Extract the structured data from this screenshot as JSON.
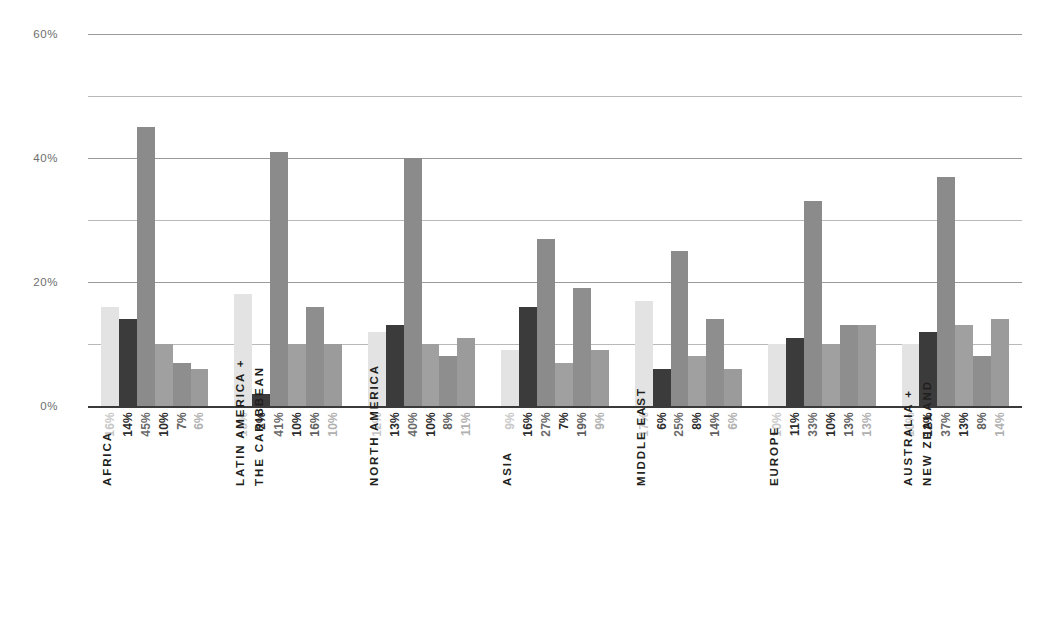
{
  "chart_data": {
    "type": "bar",
    "title": "",
    "subtitle": "",
    "xlabel": "",
    "ylabel": "",
    "ylim": [
      0,
      60
    ],
    "yticks": [
      "0%",
      "20%",
      "40%",
      "60%"
    ],
    "ytick_values": [
      0,
      20,
      40,
      60
    ],
    "minor_gridlines": [
      10,
      30,
      50
    ],
    "grid": true,
    "legend": "none",
    "value_labels": true,
    "series": [
      {
        "name": "series-1",
        "color": "#e0e0e0",
        "values": [
          16,
          18,
          12,
          9,
          17,
          10,
          10
        ]
      },
      {
        "name": "series-2",
        "color": "#3c3c3c",
        "values": [
          14,
          2,
          13,
          16,
          6,
          11,
          12
        ]
      },
      {
        "name": "series-3",
        "color": "#8c8c8c",
        "values": [
          45,
          41,
          40,
          27,
          25,
          33,
          37
        ]
      },
      {
        "name": "series-4",
        "color": "#9e9e9e",
        "values": [
          10,
          10,
          10,
          7,
          8,
          10,
          13
        ]
      },
      {
        "name": "series-5",
        "color": "#8f8f8f",
        "values": [
          7,
          16,
          8,
          19,
          14,
          13,
          8
        ]
      },
      {
        "name": "series-6",
        "color": "#9a9a9a",
        "values": [
          6,
          10,
          11,
          9,
          6,
          13,
          14
        ]
      }
    ],
    "categories": [
      "AFRICA",
      "LATIN AMERICA + THE CARIBBEAN",
      "NORTH AMERICA",
      "ASIA",
      "MIDDLE EAST",
      "EUROPE",
      "AUSTRALIA + NEW ZEALAND"
    ],
    "groups": [
      {
        "id": "africa",
        "label_lines": [
          "AFRICA"
        ],
        "value_labels": [
          "16%",
          "14%",
          "45%",
          "10%",
          "7%",
          "6%"
        ],
        "values": [
          16,
          14,
          45,
          10,
          7,
          6
        ]
      },
      {
        "id": "latin-america-caribbean",
        "label_lines": [
          "LATIN AMERICA +",
          "THE CARIBBEAN"
        ],
        "value_labels": [
          "18%",
          "2%",
          "41%",
          "10%",
          "16%",
          "10%"
        ],
        "values": [
          18,
          2,
          41,
          10,
          16,
          10
        ]
      },
      {
        "id": "north-america",
        "label_lines": [
          "NORTH AMERICA"
        ],
        "value_labels": [
          "12%",
          "13%",
          "40%",
          "10%",
          "8%",
          "11%"
        ],
        "values": [
          12,
          13,
          40,
          10,
          8,
          11
        ]
      },
      {
        "id": "asia",
        "label_lines": [
          "ASIA"
        ],
        "value_labels": [
          "9%",
          "16%",
          "27%",
          "7%",
          "19%",
          "9%"
        ],
        "values": [
          9,
          16,
          27,
          7,
          19,
          9
        ]
      },
      {
        "id": "middle-east",
        "label_lines": [
          "MIDDLE EAST"
        ],
        "value_labels": [
          "17%",
          "6%",
          "25%",
          "8%",
          "14%",
          "6%"
        ],
        "values": [
          17,
          6,
          25,
          8,
          14,
          6
        ]
      },
      {
        "id": "europe",
        "label_lines": [
          "EUROPE"
        ],
        "value_labels": [
          "10%",
          "11%",
          "33%",
          "10%",
          "13%",
          "13%"
        ],
        "values": [
          10,
          11,
          33,
          10,
          13,
          13
        ]
      },
      {
        "id": "australia-new-zealand",
        "label_lines": [
          "AUSTRALIA +",
          "NEW ZEALAND"
        ],
        "value_labels": [
          "10%",
          "12%",
          "37%",
          "13%",
          "8%",
          "14%"
        ],
        "values": [
          10,
          12,
          37,
          13,
          8,
          14
        ]
      }
    ],
    "bar_colors": [
      "#e3e3e3",
      "#3b3b3b",
      "#8b8b8b",
      "#a0a0a0",
      "#8e8e8e",
      "#9b9b9b"
    ],
    "value_label_colors": [
      "#c8c8c8",
      "#2b2b2b",
      "#6a6a6a",
      "#2b2b2b",
      "#5e5e5e",
      "#b0b0b0"
    ]
  },
  "axis": {
    "y_max": 60,
    "y_min": 0
  }
}
